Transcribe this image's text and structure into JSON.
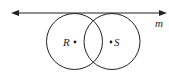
{
  "diagram": {
    "line": {
      "label": "m",
      "x1": 12,
      "y1": 13,
      "x2": 166,
      "y2": 13
    },
    "circles": [
      {
        "name": "R",
        "label": "R",
        "cx": 74.5,
        "cy": 41.5,
        "r": 28
      },
      {
        "name": "S",
        "label": "S",
        "cx": 112,
        "cy": 41.5,
        "r": 28
      }
    ],
    "colors": {
      "stroke": "#222222",
      "background": "#ffffff"
    }
  }
}
